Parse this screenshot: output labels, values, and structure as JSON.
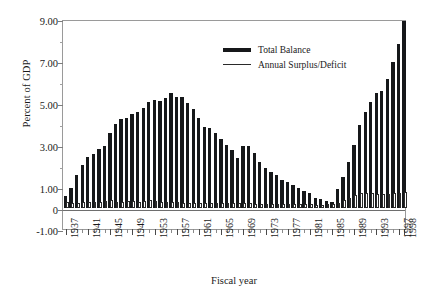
{
  "chart_data": {
    "type": "bar",
    "title": "",
    "xlabel": "Fiscal year",
    "ylabel": "Percent of GDP",
    "ylim": [
      -1.0,
      9.0
    ],
    "ytick_labels": [
      "9.00",
      "7.00",
      "5.00",
      "3.00",
      "1.00",
      "0",
      "-1.00"
    ],
    "ytick_values": [
      9.0,
      7.0,
      5.0,
      3.0,
      1.0,
      0.0,
      -1.0
    ],
    "yminor_values": [
      8.0,
      6.0,
      4.0,
      2.0
    ],
    "grid": false,
    "legend_position": "top-center",
    "categories": [
      "1937",
      "1938",
      "1939",
      "1940",
      "1941",
      "1942",
      "1943",
      "1944",
      "1945",
      "1946",
      "1947",
      "1948",
      "1949",
      "1950",
      "1951",
      "1952",
      "1953",
      "1954",
      "1955",
      "1956",
      "1957",
      "1958",
      "1959",
      "1960",
      "1961",
      "1962",
      "1963",
      "1964",
      "1965",
      "1966",
      "1967",
      "1968",
      "1969",
      "1970",
      "1971",
      "1972",
      "1973",
      "1974",
      "1975",
      "1976",
      "1977",
      "1978",
      "1979",
      "1980",
      "1981",
      "1982",
      "1983",
      "1984",
      "1985",
      "1986",
      "1987",
      "1988",
      "1989",
      "1990",
      "1991",
      "1992",
      "1993",
      "1994",
      "1995",
      "1996",
      "1997",
      "1998"
    ],
    "xtick_labels": [
      "1937",
      "1941",
      "1945",
      "1949",
      "1953",
      "1957",
      "1961",
      "1965",
      "1969",
      "1973",
      "1977",
      "1981",
      "1985",
      "1989",
      "1993",
      "1997",
      "1998"
    ],
    "series": [
      {
        "name": "Total Balance",
        "style": "solid-black-bar",
        "color": "#16181a",
        "values": [
          0.55,
          0.95,
          1.55,
          2.05,
          2.45,
          2.55,
          2.8,
          2.95,
          3.55,
          4.0,
          4.25,
          4.3,
          4.5,
          4.55,
          4.75,
          5.05,
          5.15,
          5.1,
          5.25,
          5.5,
          5.3,
          5.3,
          5.0,
          4.7,
          4.3,
          3.85,
          3.8,
          3.55,
          3.3,
          3.0,
          2.75,
          2.4,
          2.95,
          2.95,
          2.6,
          2.2,
          1.9,
          1.7,
          1.55,
          1.35,
          1.25,
          1.1,
          0.95,
          0.8,
          0.7,
          0.5,
          0.45,
          0.35,
          0.3,
          0.9,
          1.5,
          2.2,
          3.0,
          3.95,
          4.55,
          5.05,
          5.5,
          5.55,
          6.15,
          6.95,
          7.8,
          8.9
        ]
      },
      {
        "name": "Annual Surplus/Deficit",
        "style": "hollow-white-bar",
        "color": "#ffffff",
        "outline": "#2a2a2a",
        "values": [
          0.3,
          0.22,
          0.26,
          0.28,
          0.27,
          0.28,
          0.3,
          0.32,
          0.36,
          0.3,
          0.3,
          0.32,
          0.32,
          0.3,
          0.34,
          0.36,
          0.34,
          0.3,
          0.28,
          0.3,
          0.3,
          0.26,
          0.24,
          0.24,
          0.22,
          0.22,
          0.22,
          0.22,
          0.22,
          0.24,
          0.26,
          0.22,
          0.24,
          0.22,
          0.2,
          0.2,
          0.2,
          0.2,
          0.18,
          0.18,
          0.18,
          0.18,
          0.18,
          0.18,
          0.18,
          0.16,
          0.16,
          0.18,
          0.2,
          0.26,
          0.38,
          0.5,
          0.62,
          0.72,
          0.72,
          0.7,
          0.68,
          0.66,
          0.66,
          0.7,
          0.72,
          0.74
        ]
      }
    ]
  },
  "legend": {
    "items": [
      {
        "label": "Total Balance",
        "swatch": "thick-black-line"
      },
      {
        "label": "Annual Surplus/Deficit",
        "swatch": "thin-black-line"
      }
    ]
  }
}
